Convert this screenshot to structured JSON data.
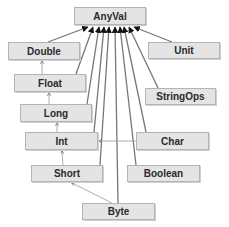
{
  "diagram": {
    "colors": {
      "node_fill": "#e4e4e4",
      "node_border": "#b4b4b4",
      "edge": "#777777",
      "text": "#2a2a2a"
    },
    "nodes": [
      {
        "id": "anyval",
        "label": "AnyVal",
        "x": 74,
        "y": 7,
        "w": 72,
        "h": 18
      },
      {
        "id": "double",
        "label": "Double",
        "x": 8,
        "y": 42,
        "w": 72,
        "h": 18
      },
      {
        "id": "unit",
        "label": "Unit",
        "x": 148,
        "y": 42,
        "w": 72,
        "h": 17
      },
      {
        "id": "float",
        "label": "Float",
        "x": 14,
        "y": 74,
        "w": 72,
        "h": 18
      },
      {
        "id": "stringops",
        "label": "StringOps",
        "x": 145,
        "y": 88,
        "w": 71,
        "h": 17
      },
      {
        "id": "long",
        "label": "Long",
        "x": 20,
        "y": 104,
        "w": 72,
        "h": 18
      },
      {
        "id": "int",
        "label": "Int",
        "x": 25,
        "y": 132,
        "w": 73,
        "h": 18
      },
      {
        "id": "char",
        "label": "Char",
        "x": 136,
        "y": 132,
        "w": 73,
        "h": 18
      },
      {
        "id": "short",
        "label": "Short",
        "x": 31,
        "y": 165,
        "w": 72,
        "h": 17
      },
      {
        "id": "boolean",
        "label": "Boolean",
        "x": 127,
        "y": 165,
        "w": 73,
        "h": 17
      },
      {
        "id": "byte",
        "label": "Byte",
        "x": 82,
        "y": 203,
        "w": 73,
        "h": 17
      }
    ],
    "edges": [
      {
        "from": "double",
        "to": "anyval",
        "type": "subtype"
      },
      {
        "from": "float",
        "to": "anyval",
        "type": "subtype"
      },
      {
        "from": "long",
        "to": "anyval",
        "type": "subtype"
      },
      {
        "from": "int",
        "to": "anyval",
        "type": "subtype"
      },
      {
        "from": "short",
        "to": "anyval",
        "type": "subtype"
      },
      {
        "from": "byte",
        "to": "anyval",
        "type": "subtype"
      },
      {
        "from": "boolean",
        "to": "anyval",
        "type": "subtype"
      },
      {
        "from": "char",
        "to": "anyval",
        "type": "subtype"
      },
      {
        "from": "stringops",
        "to": "anyval",
        "type": "subtype"
      },
      {
        "from": "unit",
        "to": "anyval",
        "type": "subtype"
      },
      {
        "from": "float",
        "to": "double",
        "type": "implicit-conversion"
      },
      {
        "from": "long",
        "to": "float",
        "type": "implicit-conversion"
      },
      {
        "from": "int",
        "to": "long",
        "type": "implicit-conversion"
      },
      {
        "from": "short",
        "to": "int",
        "type": "implicit-conversion"
      },
      {
        "from": "byte",
        "to": "short",
        "type": "implicit-conversion"
      },
      {
        "from": "char",
        "to": "int",
        "type": "implicit-conversion"
      }
    ]
  }
}
